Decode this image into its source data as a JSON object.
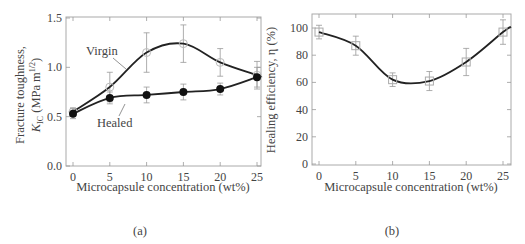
{
  "chart_data": [
    {
      "id": "a",
      "type": "line",
      "panel_label": "(a)",
      "title": "",
      "xlabel": "Microcapsule concentration (wt%)",
      "ylabel_line1": "Fracture toughness,",
      "ylabel_line2": "K",
      "ylabel_sub": "IC",
      "ylabel_units": "(MPa m",
      "ylabel_sup": "1/2",
      "ylabel_close": ")",
      "x": [
        0,
        5,
        10,
        15,
        20,
        25
      ],
      "xticks": [
        "0",
        "5",
        "10",
        "15",
        "20",
        "25"
      ],
      "yticks": [
        "0.0",
        "0.5",
        "1.0",
        "1.5"
      ],
      "xlim": [
        -1.5,
        26
      ],
      "ylim": [
        0,
        1.5
      ],
      "grid": false,
      "series": [
        {
          "name": "Virgin",
          "marker": "open-circle",
          "values": [
            0.55,
            0.8,
            1.15,
            1.24,
            1.05,
            0.92
          ],
          "err": [
            0.04,
            0.15,
            0.2,
            0.19,
            0.14,
            0.14
          ]
        },
        {
          "name": "Healed",
          "marker": "filled-circle",
          "values": [
            0.53,
            0.69,
            0.72,
            0.75,
            0.78,
            0.9
          ],
          "err": [
            0.05,
            0.06,
            0.08,
            0.08,
            0.06,
            0.1
          ]
        }
      ],
      "annotations": [
        {
          "text": "Virgin"
        },
        {
          "text": "Healed"
        }
      ]
    },
    {
      "id": "b",
      "type": "line",
      "panel_label": "(b)",
      "title": "",
      "xlabel": "Microcapsule concentration (wt%)",
      "ylabel": "Healing efficiency, η  (%)",
      "x": [
        0,
        5,
        10,
        15,
        20,
        25
      ],
      "xticks": [
        "0",
        "5",
        "10",
        "15",
        "20",
        "25"
      ],
      "yticks": [
        "0",
        "20",
        "40",
        "60",
        "80",
        "100"
      ],
      "xlim": [
        -1.5,
        26
      ],
      "ylim": [
        0,
        110
      ],
      "grid": false,
      "series": [
        {
          "name": "Healing efficiency",
          "marker": "open-square",
          "values": [
            97,
            87,
            62,
            61,
            75,
            97
          ],
          "err": [
            5,
            7,
            5,
            7,
            10,
            9
          ]
        }
      ]
    }
  ]
}
